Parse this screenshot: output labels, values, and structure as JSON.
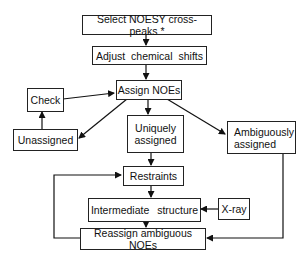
{
  "diagram": {
    "type": "flowchart",
    "nodes": {
      "select": {
        "label": "Select NOESY cross-peaks *"
      },
      "adjust": {
        "label": "Adjust chemical shifts"
      },
      "assign": {
        "label": "Assign NOEs"
      },
      "check": {
        "label": "Check"
      },
      "unassigned": {
        "label": "Unassigned"
      },
      "unique": {
        "label": "Uniquely assigned"
      },
      "ambiguous": {
        "label": "Ambiguously assigned"
      },
      "restraints": {
        "label": "Restraints"
      },
      "intermediate": {
        "label": "Intermediate structure"
      },
      "xray": {
        "label": "X-ray"
      },
      "reassign": {
        "label": "Reassign ambiguous NOEs"
      }
    },
    "edges": [
      [
        "Select NOESY cross-peaks *",
        "Adjust chemical shifts"
      ],
      [
        "Adjust chemical shifts",
        "Assign NOEs"
      ],
      [
        "Assign NOEs",
        "Unassigned"
      ],
      [
        "Assign NOEs",
        "Uniquely assigned"
      ],
      [
        "Assign NOEs",
        "Ambiguously assigned"
      ],
      [
        "Unassigned",
        "Check"
      ],
      [
        "Check",
        "Assign NOEs"
      ],
      [
        "Uniquely assigned",
        "Restraints"
      ],
      [
        "Restraints",
        "Intermediate structure"
      ],
      [
        "X-ray",
        "Intermediate structure"
      ],
      [
        "Intermediate structure",
        "Reassign ambiguous NOEs"
      ],
      [
        "Ambiguously assigned",
        "Reassign ambiguous NOEs"
      ],
      [
        "Reassign ambiguous NOEs",
        "Restraints"
      ]
    ]
  }
}
